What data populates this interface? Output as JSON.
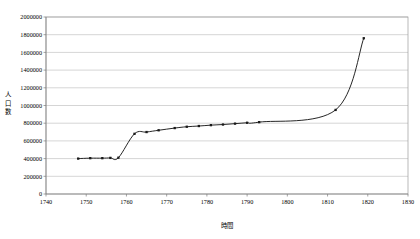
{
  "chart_data": {
    "type": "line",
    "title": "",
    "xlabel": "時間",
    "ylabel": "人口数",
    "ylabel_chars": [
      "人",
      "口",
      "数"
    ],
    "xlim": [
      1740,
      1830
    ],
    "ylim": [
      0,
      2000000
    ],
    "xticks": [
      1740,
      1750,
      1760,
      1770,
      1780,
      1790,
      1800,
      1810,
      1820,
      1830
    ],
    "xtick_labels": [
      "1740",
      "1750",
      "1760",
      "1770",
      "1780",
      "1790",
      "1800",
      "1810",
      "1820",
      "1830"
    ],
    "yticks": [
      0,
      200000,
      400000,
      600000,
      800000,
      1000000,
      1200000,
      1400000,
      1600000,
      1800000,
      2000000
    ],
    "ytick_labels": [
      "0",
      "200000",
      "400000",
      "600000",
      "800000",
      "1000000",
      "1200000",
      "1400000",
      "1600000",
      "1800000",
      "2000000"
    ],
    "grid": "horizontal",
    "legend": "none",
    "marker": "square",
    "line_color": "#1a1a1a",
    "grid_color": "#b8b8b8",
    "border_color": "#9a9a9a",
    "series": [
      {
        "name": "人口数",
        "x": [
          1748,
          1751,
          1754,
          1756,
          1758,
          1762,
          1765,
          1768,
          1772,
          1775,
          1778,
          1781,
          1784,
          1787,
          1790,
          1793,
          1812,
          1819
        ],
        "values": [
          400000,
          405000,
          405000,
          408000,
          410000,
          680000,
          700000,
          720000,
          745000,
          760000,
          768000,
          778000,
          785000,
          795000,
          805000,
          812000,
          950000,
          1760000
        ]
      }
    ]
  }
}
